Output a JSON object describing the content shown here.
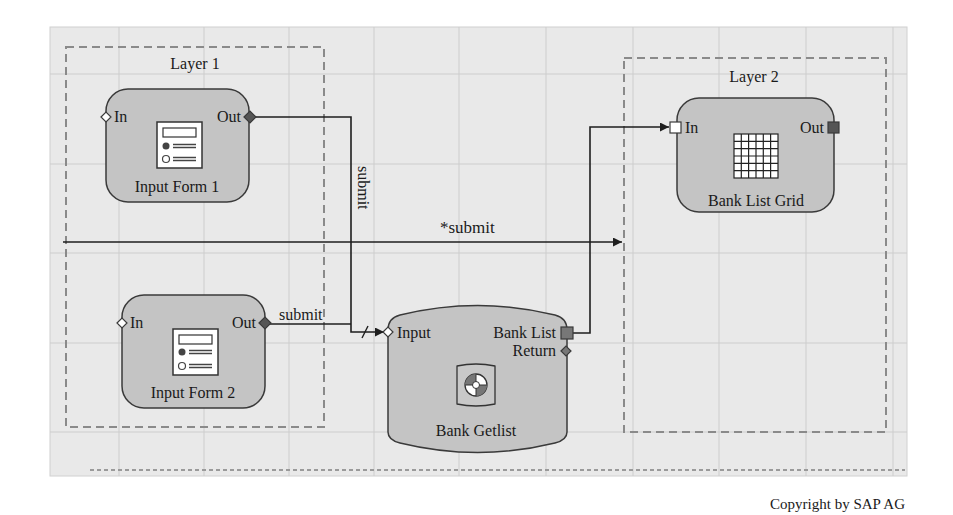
{
  "colors": {
    "canvas_bg": "#e9e9e9",
    "grid_line": "#cfcfcf",
    "node_fill": "#c4c4c4",
    "node_stroke": "#3a3a3a",
    "layer_dash": "#8a8a8a",
    "port_dark": "#555555",
    "wire": "#1e1e1e"
  },
  "layers": [
    {
      "label": "Layer 1"
    },
    {
      "label": "Layer 2"
    }
  ],
  "nodes": {
    "input_form_1": {
      "title": "Input Form 1",
      "port_in": "In",
      "port_out": "Out",
      "icon": "form-icon"
    },
    "input_form_2": {
      "title": "Input Form 2",
      "port_in": "In",
      "port_out": "Out",
      "icon": "form-icon"
    },
    "bank_list_grid": {
      "title": "Bank List Grid",
      "port_in": "In",
      "port_out": "Out",
      "icon": "grid-table-icon"
    },
    "bank_getlist": {
      "title": "Bank Getlist",
      "port_in": "Input",
      "port_out_1": "Bank List",
      "port_out_2": "Return",
      "icon": "lifebuoy-icon"
    }
  },
  "edges": [
    {
      "from": "Input Form 1.Out",
      "to": "Bank Getlist.Input",
      "label": "submit"
    },
    {
      "from": "Input Form 2.Out",
      "to": "Bank Getlist.Input",
      "label": "submit"
    },
    {
      "from": "Layer 1",
      "to": "Layer 2",
      "label": "*submit"
    },
    {
      "from": "Bank Getlist.Bank List",
      "to": "Bank List Grid.In",
      "label": ""
    }
  ],
  "footer": {
    "copyright": "Copyright by SAP AG"
  }
}
